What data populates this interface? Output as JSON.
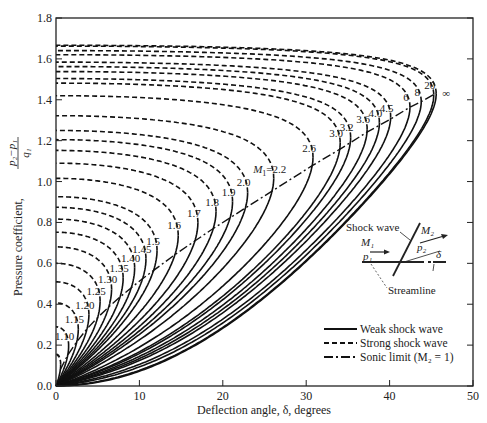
{
  "chart_data": {
    "type": "line",
    "title": "",
    "xlabel": "Deflection angle, δ, degrees",
    "ylabel": "Pressure coefficient, (p2 − p1)/q1",
    "xlim": [
      0,
      50
    ],
    "ylim": [
      0,
      1.8
    ],
    "x_ticks": [
      0,
      10,
      20,
      30,
      40,
      50
    ],
    "y_ticks": [
      0.0,
      0.2,
      0.4,
      0.6,
      0.8,
      1.0,
      1.2,
      1.4,
      1.6,
      1.8
    ],
    "grid": false,
    "gamma": 1.4,
    "mach_numbers": [
      1.05,
      1.1,
      1.15,
      1.2,
      1.25,
      1.3,
      1.35,
      1.4,
      1.45,
      1.5,
      1.6,
      1.7,
      1.8,
      1.9,
      2.0,
      2.2,
      2.6,
      3.0,
      3.2,
      3.6,
      4.0,
      4.5,
      6,
      8,
      20,
      "∞"
    ],
    "curve_labels": [
      "1.10",
      "1.15",
      "1.20",
      "1.25",
      "1.30",
      "1.35",
      "1.40",
      "1.45",
      "1.5",
      "1.6",
      "1.7",
      "1.8",
      "1.9",
      "2.0",
      "M1=2.2",
      "2.6",
      "3.0",
      "3.2",
      "3.6",
      "4.0",
      "4.5",
      "6",
      "8",
      "20",
      "∞"
    ],
    "series": [
      {
        "name": "Weak shock wave",
        "style": "solid"
      },
      {
        "name": "Strong shock wave",
        "style": "dashed"
      },
      {
        "name": "Sonic limit (M2 = 1)",
        "style": "dash-dot"
      }
    ],
    "key_points": {
      "max_deflection_infinite_mach_deg": 45.6,
      "cp_at_max_deflection_infinite_mach": 1.42,
      "normal_shock_cp_infinite_mach": 1.667,
      "normal_shock_cp_M1_5": 0.741,
      "normal_shock_cp_M1_1": 0.289
    },
    "legend_position": "lower right"
  },
  "axes": {
    "x_label": "Deflection angle, δ, degrees",
    "y_label_prefix": "Pressure coefficient,",
    "y_label_num": "p₂−p₁",
    "y_label_den": "q₁"
  },
  "legend": {
    "weak": "Weak shock wave",
    "strong": "Strong shock wave",
    "sonic": "Sonic limit (M₂ = 1)"
  },
  "inset": {
    "shock_wave": "Shock wave",
    "m1": "M₁",
    "p1": "p₁",
    "m2": "M₂",
    "p2": "p₂",
    "delta": "δ",
    "streamline": "Streamline"
  }
}
